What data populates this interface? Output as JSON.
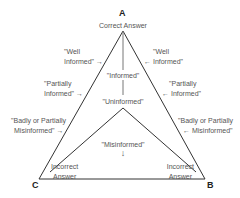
{
  "diagram": {
    "vertices": {
      "A": {
        "letter": "A",
        "label": "Correct  Answer"
      },
      "B": {
        "letter": "B",
        "label_line1": "Incorrect",
        "label_line2": "Answer"
      },
      "C": {
        "letter": "C",
        "label_line1": "Incorrect",
        "label_line2": "Answer"
      }
    },
    "center_labels": {
      "informed": "\"Informed\"",
      "uninformed": "\"Uninformed\"",
      "misinformed": "\"Misinformed\"",
      "misinformed_arrow": "↓"
    },
    "left_labels": [
      {
        "line1": "\"Well",
        "line2": "Informed\" →"
      },
      {
        "line1": "\"Partially",
        "line2": "Informed\" →"
      },
      {
        "line1": "\"Badly or Partially",
        "line2": "Misinformed\" →"
      }
    ],
    "right_labels": [
      {
        "line1": "\"Well",
        "line2": "← Informed\""
      },
      {
        "line1": "\"Partially",
        "line2": "← Informed\""
      },
      {
        "line1": "\"Badly or Partially",
        "line2": "← Misinformed\""
      }
    ],
    "colors": {
      "line": "#333333",
      "text": "#555555",
      "vertex": "#222222"
    }
  }
}
